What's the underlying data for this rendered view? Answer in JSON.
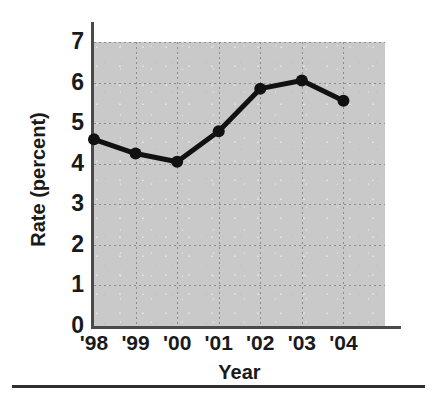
{
  "chart_data": {
    "type": "line",
    "title": "",
    "xlabel": "Year",
    "ylabel": "Rate (percent)",
    "categories": [
      "'98",
      "'99",
      "'00",
      "'01",
      "'02",
      "'03",
      "'04"
    ],
    "x": [
      1998,
      1999,
      2000,
      2001,
      2002,
      2003,
      2004
    ],
    "values": [
      4.6,
      4.25,
      4.05,
      4.8,
      5.85,
      6.05,
      5.55
    ],
    "series": [
      {
        "name": "Rate",
        "values": [
          4.6,
          4.25,
          4.05,
          4.8,
          5.85,
          6.05,
          5.55
        ]
      }
    ],
    "ylim": [
      0,
      7
    ],
    "yticks": [
      7,
      6,
      5,
      4,
      3,
      2,
      1,
      0
    ],
    "ytick_labels": [
      "7",
      "6",
      "5",
      "4",
      "3",
      "2",
      "1",
      "0"
    ],
    "xtick_labels": [
      "'98",
      "'99",
      "'00",
      "'01",
      "'02",
      "'03",
      "'04"
    ],
    "grid": true,
    "grid_style": "dotted",
    "legend": "none",
    "marker": "circle",
    "line_color": "#111111",
    "marker_color": "#111111",
    "plot_background": "#c9c9c9",
    "axis_color": "#4a4a4a",
    "grid_color": "#8d8d8d",
    "text_color": "#1a1a1a"
  }
}
